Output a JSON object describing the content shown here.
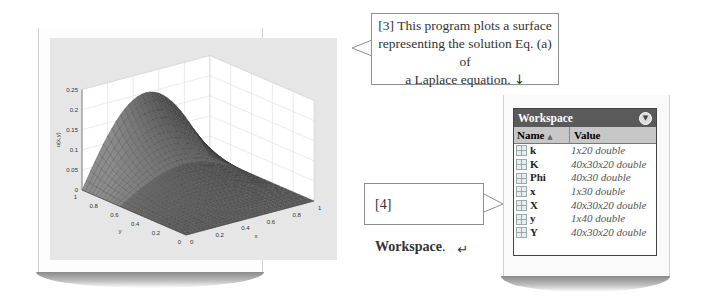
{
  "figure": {
    "zlabel": "u(x,y)",
    "xlabel": "x",
    "ylabel": "y",
    "z_ticks": [
      "0",
      "0.05",
      "0.1",
      "0.15",
      "0.2",
      "0.25"
    ],
    "x_ticks": [
      "0",
      "0.2",
      "0.4",
      "0.6",
      "0.8",
      "1"
    ],
    "y_ticks": [
      "0",
      "0.2",
      "0.4",
      "0.6",
      "0.8",
      "1"
    ]
  },
  "chart_data": {
    "type": "surface",
    "title": "",
    "xlabel": "x",
    "ylabel": "y",
    "zlabel": "u(x,y)",
    "xlim": [
      0,
      1
    ],
    "ylim": [
      0,
      1
    ],
    "zlim": [
      0,
      0.25
    ],
    "peak": {
      "x": 0.5,
      "y": 1,
      "z": 0.2
    }
  },
  "callouts": {
    "c3_lines": [
      "[3] This program plots a surface",
      "representing the solution Eq. (a) of",
      "a Laplace equation."
    ],
    "c3_arrow": "↓",
    "c4_prefix": "[4] ",
    "c4_bold": "Workspace",
    "c4_suffix": ".",
    "c4_arrow": "↵"
  },
  "workspace": {
    "title": "Workspace",
    "menu_icon": "▼",
    "col_name": "Name",
    "sort_icon": "▲",
    "col_value": "Value",
    "rows": [
      {
        "name": "k",
        "value": "1x20 double"
      },
      {
        "name": "K",
        "value": "40x30x20 double"
      },
      {
        "name": "Phi",
        "value": "40x30 double"
      },
      {
        "name": "x",
        "value": "1x30 double"
      },
      {
        "name": "X",
        "value": "40x30x20 double"
      },
      {
        "name": "y",
        "value": "1x40 double"
      },
      {
        "name": "Y",
        "value": "40x30x20 double"
      }
    ]
  }
}
